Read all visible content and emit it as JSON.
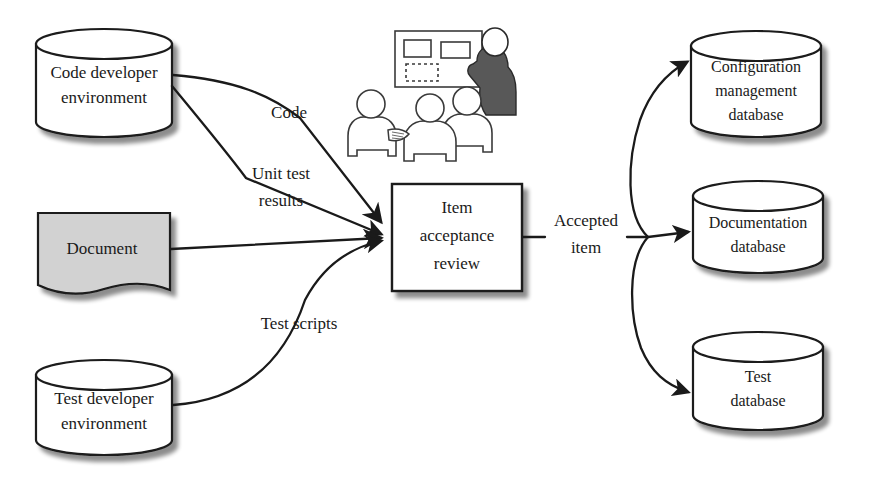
{
  "diagram": {
    "background_color": "#ffffff",
    "stroke_color": "#1a1a1a",
    "document_fill_color": "#d2d2d2",
    "presenter_fill_color": "#585858",
    "shadow_color": "#bcbcbc"
  },
  "nodes": {
    "code_developer_environment": {
      "shape": "cylinder",
      "line1": "Code developer",
      "line2": "environment"
    },
    "document": {
      "shape": "document",
      "line1": "Document"
    },
    "test_developer_environment": {
      "shape": "cylinder",
      "line1": "Test developer",
      "line2": "environment"
    },
    "item_acceptance_review": {
      "shape": "rectangle",
      "line1": "Item",
      "line2": "acceptance",
      "line3": "review"
    },
    "configuration_management_database": {
      "shape": "cylinder",
      "line1": "Configuration",
      "line2": "management",
      "line3": "database"
    },
    "documentation_database": {
      "shape": "cylinder",
      "line1": "Documentation",
      "line2": "database"
    },
    "test_database": {
      "shape": "cylinder",
      "line1": "Test",
      "line2": "database"
    }
  },
  "edges": {
    "code": {
      "label": "Code",
      "from": "code_developer_environment",
      "to": "item_acceptance_review"
    },
    "unit_test_results": {
      "label_line1": "Unit test",
      "label_line2": "results",
      "from": "code_developer_environment",
      "to": "item_acceptance_review"
    },
    "document_edge": {
      "label": "",
      "from": "document",
      "to": "item_acceptance_review"
    },
    "test_scripts": {
      "label": "Test scripts",
      "from": "test_developer_environment",
      "to": "item_acceptance_review"
    },
    "accepted_item": {
      "label_line1": "Accepted",
      "label_line2": "item",
      "from": "item_acceptance_review",
      "to": "configuration_management_database, documentation_database, test_database"
    }
  },
  "illustration": {
    "name": "review-meeting-illustration",
    "description": "Presenter at a whiteboard with three seated reviewers",
    "whiteboard_items": [
      "rectangle",
      "rectangle",
      "dashed-rectangle"
    ],
    "people_count": 4,
    "presenter_count": 1,
    "audience_count": 3
  }
}
